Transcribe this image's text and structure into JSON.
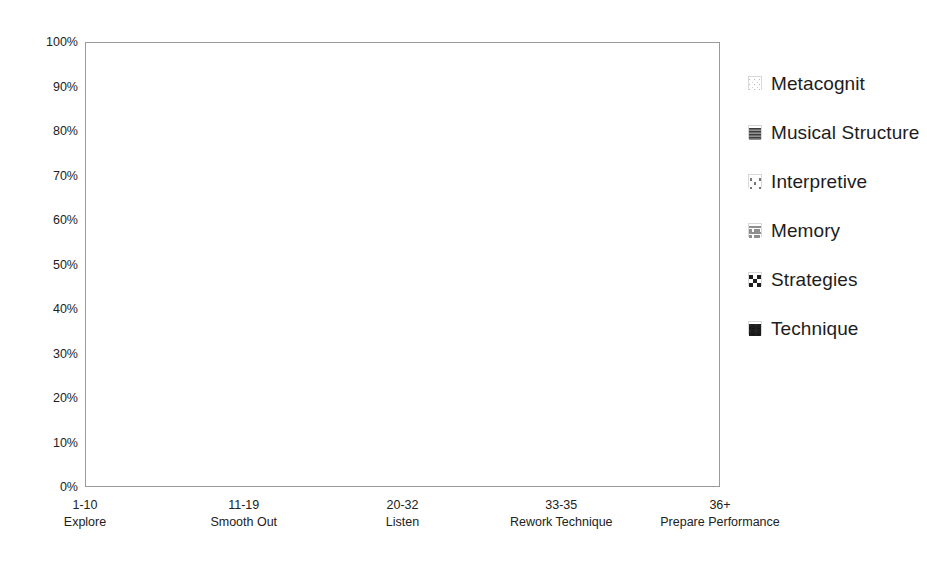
{
  "chart_data": {
    "type": "area",
    "stacked": true,
    "stack_mode": "percent",
    "title": "",
    "xlabel": "",
    "ylabel": "",
    "ylim": [
      0,
      100
    ],
    "ytick_labels": [
      "0%",
      "10%",
      "20%",
      "30%",
      "40%",
      "50%",
      "60%",
      "70%",
      "80%",
      "90%",
      "100%"
    ],
    "ytick_values": [
      0,
      10,
      20,
      30,
      40,
      50,
      60,
      70,
      80,
      90,
      100
    ],
    "grid": false,
    "legend_position": "right",
    "categories": [
      "1-10",
      "11-19",
      "20-32",
      "33-35",
      "36+"
    ],
    "category_sublabels": [
      "Explore",
      "Smooth Out",
      "Listen",
      "Rework Technique",
      "Prepare Performance"
    ],
    "series": [
      {
        "name": "Technique",
        "values": [
          46.8,
          44.8,
          41.4,
          43.0,
          31.0
        ]
      },
      {
        "name": "Strategies",
        "values": [
          5.0,
          9.9,
          5.4,
          6.8,
          11.6
        ]
      },
      {
        "name": "Memory",
        "values": [
          10.3,
          9.3,
          17.0,
          7.4,
          4.4
        ]
      },
      {
        "name": "Interpretive",
        "values": [
          4.2,
          10.5,
          12.0,
          18.9,
          20.0
        ]
      },
      {
        "name": "Musical Structure",
        "values": [
          12.6,
          7.9,
          11.9,
          9.3,
          4.2
        ]
      },
      {
        "name": "Metacognitive",
        "values": [
          21.1,
          17.6,
          12.3,
          14.6,
          28.8
        ]
      }
    ],
    "cumulative_tops": {
      "Technique": [
        46.8,
        44.8,
        41.4,
        43.0,
        31.0
      ],
      "Strategies": [
        51.8,
        54.7,
        46.8,
        49.8,
        42.6
      ],
      "Memory": [
        62.1,
        64.0,
        63.8,
        57.2,
        47.0
      ],
      "Interpretive": [
        66.3,
        74.5,
        75.8,
        76.1,
        67.0
      ],
      "Musical Structure": [
        78.9,
        82.4,
        87.7,
        85.4,
        71.2
      ],
      "Metacognitive": [
        100,
        100,
        100,
        100,
        100
      ]
    }
  },
  "legend": {
    "items": [
      {
        "label": "Metacognit",
        "pattern": "fine-dots-light",
        "color": "#f2f2f2"
      },
      {
        "label": "Musical Structure",
        "pattern": "horizontal-lines",
        "color": "#787878"
      },
      {
        "label": "Interpretive",
        "pattern": "sparse-dots",
        "color": "#fafafa"
      },
      {
        "label": "Memory",
        "pattern": "brick-hatch",
        "color": "#c8c8c8"
      },
      {
        "label": "Strategies",
        "pattern": "checkerboard",
        "color": "#555555"
      },
      {
        "label": "Technique",
        "pattern": "solid-dark",
        "color": "#1c1c1c"
      }
    ]
  },
  "axes": {
    "y_ticks": [
      "100%",
      "90%",
      "80%",
      "70%",
      "60%",
      "50%",
      "40%",
      "30%",
      "20%",
      "10%",
      "0%"
    ],
    "x_ticks": [
      {
        "line1": "1-10",
        "line2": "Explore"
      },
      {
        "line1": "11-19",
        "line2": "Smooth Out"
      },
      {
        "line1": "20-32",
        "line2": "Listen"
      },
      {
        "line1": "33-35",
        "line2": "Rework Technique"
      },
      {
        "line1": "36+",
        "line2": "Prepare Performance"
      }
    ]
  },
  "colors": {
    "technique": "#1c1c1c",
    "strategies": "#555555",
    "memory": "#c8c8c8",
    "interpretive": "#fafafa",
    "musical_structure": "#787878",
    "metacognitive": "#f2f2f2",
    "frame": "#9a9a9a",
    "text": "#222222"
  }
}
